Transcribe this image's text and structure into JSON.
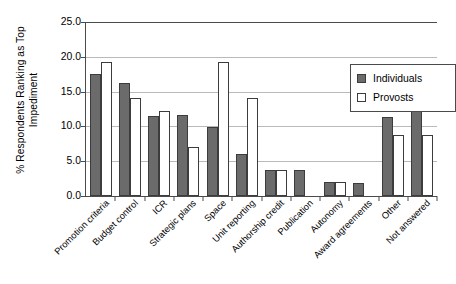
{
  "chart_data": {
    "type": "bar",
    "title": "",
    "xlabel": "",
    "ylabel": "% Respondents Ranking as Top Impediment",
    "ylabel_line1": "% Respondents Ranking as Top",
    "ylabel_line2": "Impediment",
    "ylim": [
      0.0,
      25.0
    ],
    "ytick_step": 5.0,
    "yticks": [
      "0.0",
      "5.0",
      "10.0",
      "15.0",
      "20.0",
      "25.0"
    ],
    "ytick_values": [
      0.0,
      5.0,
      10.0,
      15.0,
      20.0,
      25.0
    ],
    "grid": "horizontal",
    "legend_position": "upper-right-inside",
    "categories": [
      "Promotion criteria",
      "Budget control",
      "ICR",
      "Strategic plans",
      "Space",
      "Unit reporting",
      "Authorship credit",
      "Publication",
      "Autonomy",
      "Award agreements",
      "Other",
      "Not answered"
    ],
    "series": [
      {
        "name": "Individuals",
        "color": "#6b6b6b",
        "values": [
          17.5,
          16.3,
          11.5,
          11.7,
          9.9,
          6.0,
          3.8,
          3.8,
          2.0,
          1.9,
          11.3,
          15.6
        ]
      },
      {
        "name": "Provosts",
        "color": "#ffffff",
        "values": [
          19.3,
          14.1,
          12.2,
          7.1,
          19.3,
          14.1,
          3.8,
          null,
          2.0,
          null,
          8.8,
          8.8
        ]
      }
    ]
  },
  "legend": {
    "items": [
      {
        "label": "Individuals",
        "swatch": "filled-gray-square"
      },
      {
        "label": "Provosts",
        "swatch": "outlined-white-square"
      }
    ]
  },
  "colors": {
    "individuals_fill": "#6b6b6b",
    "provosts_fill": "#ffffff",
    "bar_outline": "#3c3c3c",
    "axis": "#4a4a4a",
    "gridline": "#b9b9b9",
    "background": "#ffffff",
    "text": "#000000"
  }
}
